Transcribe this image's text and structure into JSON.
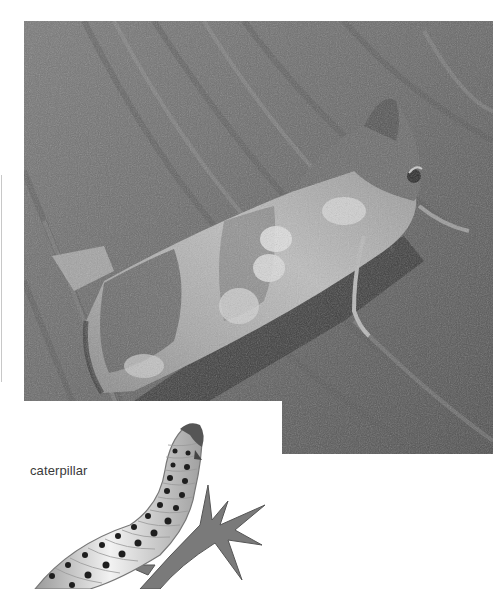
{
  "page": {
    "photo": {
      "subject": "moth-on-bark",
      "tone": "grayscale",
      "colors": {
        "bark_dark": "#3c3c3c",
        "bark_mid": "#6e6e6e",
        "bark_light": "#9a9a9a",
        "wing_light": "#d8d8d8",
        "wing_dark": "#4a4a4a"
      }
    },
    "caterpillar": {
      "label": "caterpillar",
      "illustration": "caterpillar-on-holly-leaf"
    }
  }
}
